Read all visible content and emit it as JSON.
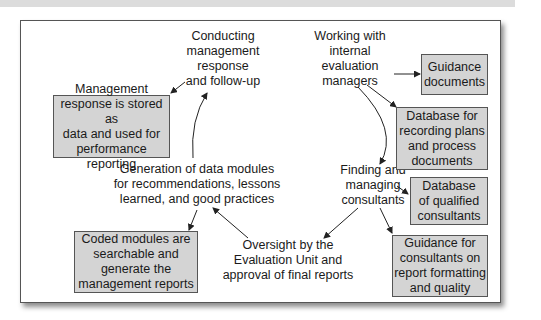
{
  "diagram": {
    "nodes": {
      "conducting": "Conducting management response and follow-up",
      "working": "Working with internal evaluation managers",
      "finding": "Finding and managing consultants",
      "oversight": "Oversight by the Evaluation Unit and approval of final reports",
      "generation": "Generation of data modules for recommendations, lessons learned, and good practices"
    },
    "node_lines": {
      "conducting": [
        "Conducting",
        "management",
        "response",
        "and follow-up"
      ],
      "working": [
        "Working with",
        "internal",
        "evaluation",
        "managers"
      ],
      "finding": [
        "Finding and",
        "managing",
        "consultants"
      ],
      "oversight": [
        "Oversight by the",
        "Evaluation Unit and",
        "approval of final reports"
      ],
      "generation": [
        "Generation of data modules",
        "for recommendations, lessons",
        "learned, and good practices"
      ]
    },
    "boxes": {
      "mgmt_response": [
        "Management",
        "response is stored as",
        "data and used for",
        "performance reporting"
      ],
      "coded_modules": [
        "Coded modules are",
        "searchable and",
        "generate the",
        "management reports"
      ],
      "guidance_docs": [
        "Guidance",
        "documents"
      ],
      "database_plans": [
        "Database for",
        "recording plans",
        "and process",
        "documents"
      ],
      "database_consultants": [
        "Database",
        "of qualified",
        "consultants"
      ],
      "guidance_consultants": [
        "Guidance for",
        "consultants on",
        "report formatting",
        "and quality"
      ]
    }
  }
}
